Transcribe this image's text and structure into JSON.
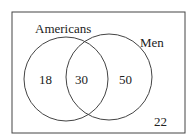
{
  "diagram": {
    "type": "venn",
    "sets": [
      {
        "name": "Americans",
        "label": "Americans"
      },
      {
        "name": "Men",
        "label": "Men"
      }
    ],
    "regions": {
      "americans_only": "18",
      "both": "30",
      "men_only": "50",
      "neither": "22"
    },
    "colors": {
      "stroke": "#333333",
      "text": "#222222",
      "background": "#ffffff"
    }
  }
}
